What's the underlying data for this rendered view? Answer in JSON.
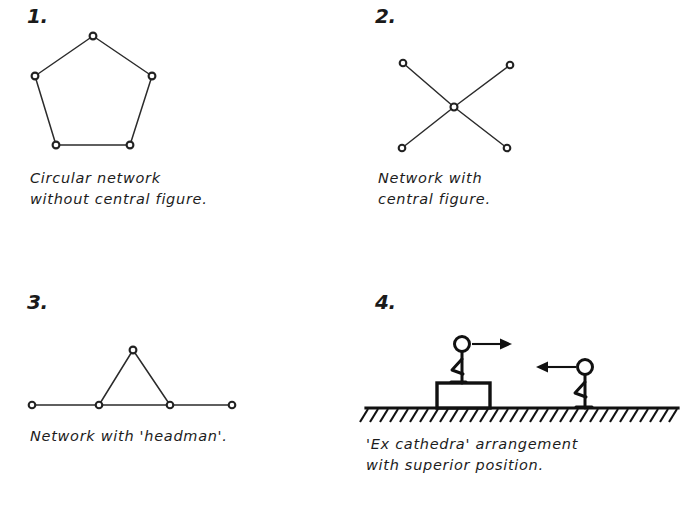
{
  "page": {
    "background_color": "#ffffff",
    "ink_color": "#1a1a1a"
  },
  "panels": [
    {
      "number": "1.",
      "caption": "Circular network\nwithout central figure.",
      "figure_type": "pentagon-network",
      "node_count": 5,
      "nodes": [
        {
          "label": "apex",
          "x": 93,
          "y": 36
        },
        {
          "label": "left",
          "x": 35,
          "y": 76
        },
        {
          "label": "right",
          "x": 152,
          "y": 76
        },
        {
          "label": "bottom-left",
          "x": 56,
          "y": 145
        },
        {
          "label": "bottom-right",
          "x": 130,
          "y": 145
        }
      ],
      "edges": [
        [
          0,
          1
        ],
        [
          0,
          2
        ],
        [
          1,
          3
        ],
        [
          2,
          4
        ],
        [
          3,
          4
        ]
      ]
    },
    {
      "number": "2.",
      "caption": "Network with\ncentral figure.",
      "figure_type": "star-network",
      "node_count": 5,
      "nodes": [
        {
          "label": "top-left",
          "x": 55,
          "y": 63
        },
        {
          "label": "top-right",
          "x": 162,
          "y": 65
        },
        {
          "label": "center",
          "x": 106,
          "y": 107
        },
        {
          "label": "bottom-left",
          "x": 54,
          "y": 148
        },
        {
          "label": "bottom-right",
          "x": 159,
          "y": 148
        }
      ],
      "edges": [
        [
          0,
          2
        ],
        [
          1,
          2
        ],
        [
          2,
          3
        ],
        [
          2,
          4
        ]
      ]
    },
    {
      "number": "3.",
      "caption": "Network with 'headman'.",
      "figure_type": "line-with-triangle",
      "node_count": 5,
      "nodes": [
        {
          "label": "far-left",
          "x": 32,
          "y": 143
        },
        {
          "label": "mid-left",
          "x": 99,
          "y": 143
        },
        {
          "label": "apex",
          "x": 133,
          "y": 88
        },
        {
          "label": "mid-right",
          "x": 170,
          "y": 143
        },
        {
          "label": "far-right",
          "x": 232,
          "y": 143
        }
      ],
      "edges": [
        [
          0,
          1
        ],
        [
          1,
          3
        ],
        [
          3,
          4
        ],
        [
          1,
          2
        ],
        [
          2,
          3
        ]
      ]
    },
    {
      "number": "4.",
      "caption": "'Ex cathedra' arrangement\nwith superior position.",
      "figure_type": "stick-figures-on-ground",
      "ground_y": 146,
      "elements": [
        {
          "label": "raised-figure",
          "head_x": 114,
          "head_y": 82,
          "on_platform": true
        },
        {
          "label": "platform",
          "x": 89,
          "y": 121,
          "width": 53,
          "height": 25
        },
        {
          "label": "standing-figure",
          "head_x": 237,
          "head_y": 105,
          "on_platform": false
        },
        {
          "label": "arrow-right",
          "from_x": 124,
          "to_x": 157,
          "y": 82,
          "direction": "right"
        },
        {
          "label": "arrow-left",
          "from_x": 230,
          "to_x": 192,
          "y": 105,
          "direction": "left"
        }
      ]
    }
  ]
}
